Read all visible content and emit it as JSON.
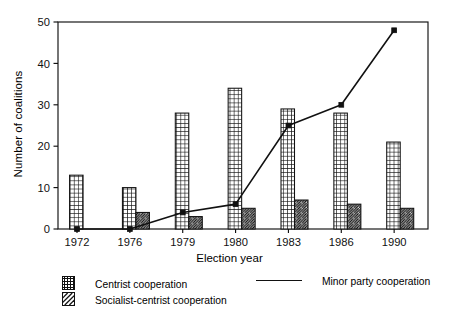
{
  "chart_data": {
    "type": "bar",
    "title": "",
    "xlabel": "Election year",
    "ylabel": "Number of coalitions",
    "categories": [
      "1972",
      "1976",
      "1979",
      "1980",
      "1983",
      "1986",
      "1990"
    ],
    "ylim": [
      0,
      50
    ],
    "yticks": [
      0,
      10,
      20,
      30,
      40,
      50
    ],
    "ytick_labels": [
      "0",
      "10",
      "20",
      "30",
      "40",
      "50"
    ],
    "grid": false,
    "legend_position": "below-plot",
    "series": [
      {
        "name": "Centrist cooperation",
        "kind": "bar",
        "pattern": "cross-hatch",
        "values": [
          13,
          10,
          28,
          34,
          29,
          28,
          21
        ]
      },
      {
        "name": "Socialist-centrist cooperation",
        "kind": "bar",
        "pattern": "diagonal-hatch",
        "values": [
          0,
          4,
          3,
          5,
          7,
          6,
          5
        ]
      },
      {
        "name": "Minor party cooperation",
        "kind": "line",
        "marker": "square",
        "values": [
          0,
          0,
          4,
          6,
          25,
          30,
          48
        ]
      }
    ]
  },
  "axes": {
    "y_title": "Number of coalitions",
    "x_title": "Election year"
  },
  "legend": {
    "centrist_label": "Centrist cooperation",
    "socialist_label": "Socialist-centrist cooperation",
    "minor_label": "Minor party cooperation"
  },
  "colors": {
    "ink": "#111111",
    "background": "#ffffff"
  }
}
